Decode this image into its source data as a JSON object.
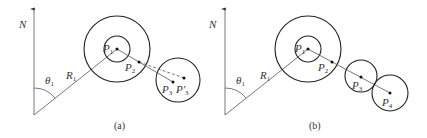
{
  "panels": [
    {
      "caption": "(a)",
      "north_label": "N",
      "angle_label": "θ",
      "angle_sub": "1",
      "radius_label": "R",
      "radius_sub": "1",
      "points": [
        {
          "name": "P",
          "sub": "1"
        },
        {
          "name": "P",
          "sub": "2"
        },
        {
          "name": "P",
          "sub": "3"
        },
        {
          "name": "P'",
          "sub": "3"
        }
      ]
    },
    {
      "caption": "(b)",
      "north_label": "N",
      "angle_label": "θ",
      "angle_sub": "1",
      "radius_label": "R",
      "radius_sub": "1",
      "points": [
        {
          "name": "P",
          "sub": "1"
        },
        {
          "name": "P",
          "sub": "2"
        },
        {
          "name": "P",
          "sub": "3"
        },
        {
          "name": "P",
          "sub": "4"
        }
      ]
    }
  ]
}
